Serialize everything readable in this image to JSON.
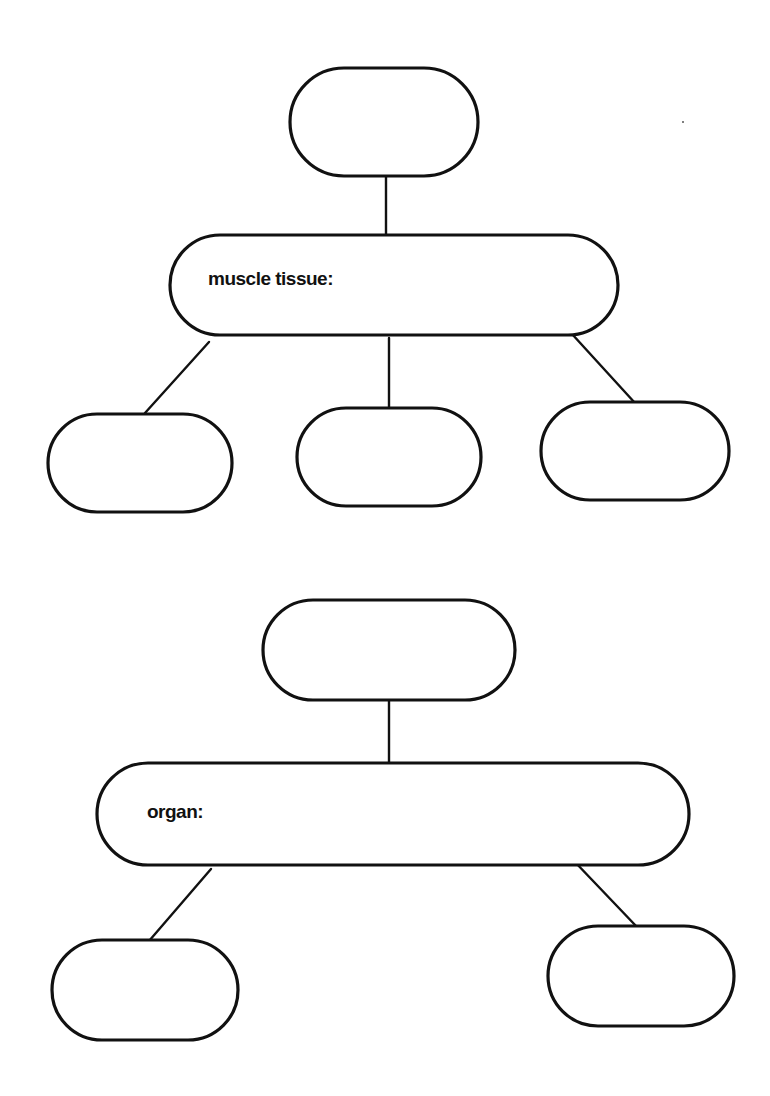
{
  "colors": {
    "stroke": "#111111",
    "background": "#ffffff"
  },
  "diagrams": [
    {
      "name": "muscle-tissue-map",
      "root": {
        "label": "",
        "x": 290,
        "y": 68,
        "w": 188,
        "h": 108
      },
      "center": {
        "label": "muscle tissue:",
        "x": 170,
        "y": 235,
        "w": 448,
        "h": 100,
        "label_x": 208,
        "label_y": 285
      },
      "children": [
        {
          "label": "",
          "x": 48,
          "y": 414,
          "w": 184,
          "h": 98
        },
        {
          "label": "",
          "x": 297,
          "y": 408,
          "w": 184,
          "h": 98
        },
        {
          "label": "",
          "x": 541,
          "y": 402,
          "w": 188,
          "h": 98
        }
      ],
      "edges": [
        {
          "x1": 386,
          "y1": 176,
          "x2": 386,
          "y2": 237
        },
        {
          "x1": 209,
          "y1": 342,
          "x2": 145,
          "y2": 413
        },
        {
          "x1": 389,
          "y1": 338,
          "x2": 389,
          "y2": 408
        },
        {
          "x1": 572,
          "y1": 334,
          "x2": 635,
          "y2": 403
        }
      ]
    },
    {
      "name": "organ-map",
      "root": {
        "label": "",
        "x": 263,
        "y": 600,
        "w": 252,
        "h": 100
      },
      "center": {
        "label": "organ:",
        "x": 97,
        "y": 763,
        "w": 592,
        "h": 102,
        "label_x": 147,
        "label_y": 818
      },
      "children": [
        {
          "label": "",
          "x": 52,
          "y": 940,
          "w": 186,
          "h": 100
        },
        {
          "label": "",
          "x": 548,
          "y": 926,
          "w": 186,
          "h": 100
        }
      ],
      "edges": [
        {
          "x1": 389,
          "y1": 700,
          "x2": 389,
          "y2": 766
        },
        {
          "x1": 211,
          "y1": 869,
          "x2": 149,
          "y2": 941
        },
        {
          "x1": 574,
          "y1": 861,
          "x2": 637,
          "y2": 927
        }
      ]
    }
  ],
  "speck": {
    "x": 683,
    "y": 122
  }
}
